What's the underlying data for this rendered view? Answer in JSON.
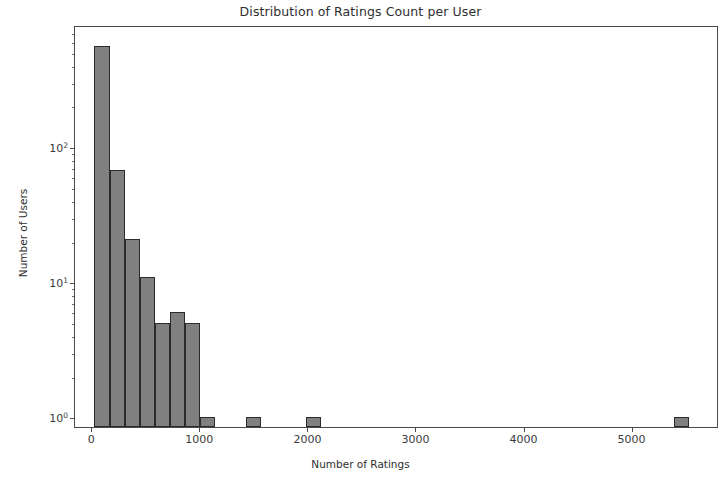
{
  "chart_data": {
    "type": "bar",
    "chart_subtype": "histogram",
    "title": "Distribution of Ratings Count per User",
    "xlabel": "Number of Ratings",
    "ylabel": "Number of Users",
    "yscale": "log",
    "xscale": "linear",
    "grid": false,
    "legend": null,
    "xlim": [
      -160,
      5800
    ],
    "ylim": [
      0.85,
      800
    ],
    "xticks": [
      0,
      1000,
      2000,
      3000,
      4000,
      5000
    ],
    "xticklabels": [
      "0",
      "1000",
      "2000",
      "3000",
      "4000",
      "5000"
    ],
    "yticks": [
      1,
      10,
      100
    ],
    "yticklabels": [
      "10⁰",
      "10¹",
      "10²"
    ],
    "bar_color": "#808080",
    "bar_edge_color": "#2b2b2b",
    "bin_width": 140,
    "bins": [
      {
        "left": 20,
        "right": 160,
        "center": 90,
        "count": 560
      },
      {
        "left": 160,
        "right": 300,
        "center": 230,
        "count": 68
      },
      {
        "left": 300,
        "right": 440,
        "center": 370,
        "count": 21
      },
      {
        "left": 440,
        "right": 580,
        "center": 510,
        "count": 11
      },
      {
        "left": 580,
        "right": 720,
        "center": 650,
        "count": 5
      },
      {
        "left": 720,
        "right": 860,
        "center": 790,
        "count": 6
      },
      {
        "left": 860,
        "right": 1000,
        "center": 930,
        "count": 5
      },
      {
        "left": 1000,
        "right": 1140,
        "center": 1070,
        "count": 1
      },
      {
        "left": 1420,
        "right": 1560,
        "center": 1490,
        "count": 1
      },
      {
        "left": 1980,
        "right": 2120,
        "center": 2050,
        "count": 1
      },
      {
        "left": 5380,
        "right": 5520,
        "center": 5450,
        "count": 1
      }
    ],
    "y_minor_ticks": [
      2,
      3,
      4,
      5,
      6,
      7,
      8,
      9,
      20,
      30,
      40,
      50,
      60,
      70,
      80,
      90,
      200,
      300,
      400,
      500,
      600,
      700
    ]
  }
}
